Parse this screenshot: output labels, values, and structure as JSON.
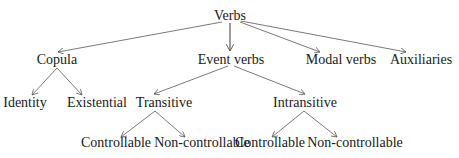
{
  "diagram": {
    "type": "tree",
    "nodes": {
      "root": {
        "label": "Verbs",
        "x": 230,
        "y": 20
      },
      "copula": {
        "label": "Copula",
        "x": 57,
        "y": 64
      },
      "event_verbs": {
        "label": "Event verbs",
        "x": 231,
        "y": 64
      },
      "modal_verbs": {
        "label": "Modal verbs",
        "x": 341,
        "y": 64
      },
      "auxiliaries": {
        "label": "Auxiliaries",
        "x": 421,
        "y": 64
      },
      "identity": {
        "label": "Identity",
        "x": 25,
        "y": 107
      },
      "existential": {
        "label": "Existential",
        "x": 97,
        "y": 107
      },
      "transitive": {
        "label": "Transitive",
        "x": 164,
        "y": 107
      },
      "intransitive": {
        "label": "Intransitive",
        "x": 305,
        "y": 107
      },
      "trans_controllable": {
        "label": "Controllable",
        "x": 116,
        "y": 147
      },
      "trans_noncontrollable": {
        "label": "Non-controllable",
        "x": 202,
        "y": 147
      },
      "intrans_controllable": {
        "label": "Controllable",
        "x": 270,
        "y": 147
      },
      "intrans_noncontrollable": {
        "label": "Non-controllable",
        "x": 355,
        "y": 147
      }
    },
    "edges": [
      {
        "from": "root",
        "to": "copula"
      },
      {
        "from": "root",
        "to": "event_verbs"
      },
      {
        "from": "root",
        "to": "modal_verbs"
      },
      {
        "from": "root",
        "to": "auxiliaries"
      },
      {
        "from": "copula",
        "to": "identity"
      },
      {
        "from": "copula",
        "to": "existential"
      },
      {
        "from": "event_verbs",
        "to": "transitive"
      },
      {
        "from": "event_verbs",
        "to": "intransitive"
      },
      {
        "from": "transitive",
        "to": "trans_controllable"
      },
      {
        "from": "transitive",
        "to": "trans_noncontrollable"
      },
      {
        "from": "intransitive",
        "to": "intrans_controllable"
      },
      {
        "from": "intransitive",
        "to": "intrans_noncontrollable"
      }
    ]
  }
}
